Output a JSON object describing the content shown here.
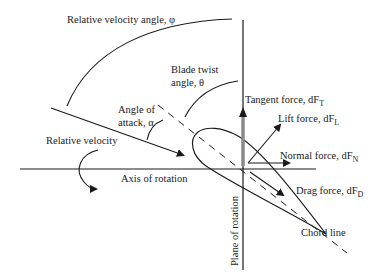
{
  "diagram": {
    "colors": {
      "line": "#1a1a1a",
      "tangent_bar": "#8a8a8a",
      "background": "#ffffff"
    },
    "labels": {
      "relative_velocity_angle": "Relative velocity angle, φ",
      "blade_twist_line1": "Blade twist",
      "blade_twist_line2": "angle, θ",
      "angle_of_attack_line1": "Angle of",
      "angle_of_attack_line2": "attack, α",
      "relative_velocity": "Relative velocity",
      "axis_of_rotation": "Axis of rotation",
      "plane_of_rotation": "Plane of rotation",
      "chord_line": "Chord line"
    },
    "forces": {
      "tangent": {
        "label": "Tangent force, dF",
        "sub": "T"
      },
      "lift": {
        "label": "Lift force, dF",
        "sub": "L"
      },
      "normal": {
        "label": "Normal force, dF",
        "sub": "N"
      },
      "drag": {
        "label": "Drag force, dF",
        "sub": "D"
      }
    }
  }
}
